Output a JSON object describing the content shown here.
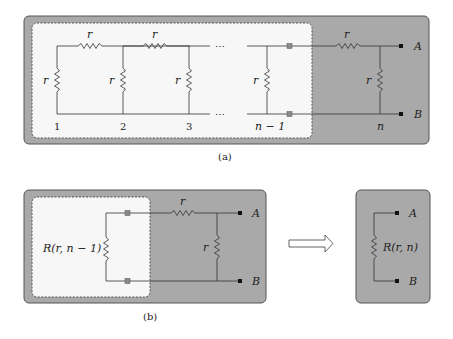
{
  "colors": {
    "panel_fill": "#a9a9a9",
    "panel_border": "#555555",
    "inner_fill": "#f7f7f7",
    "wire": "#333333",
    "node_gray": "#8a8a8a",
    "terminal": "#111111"
  },
  "figure_a": {
    "caption": "(a)",
    "resistor_label": "r",
    "ellipsis": "⋯",
    "node_labels": [
      "1",
      "2",
      "3",
      "n − 1",
      "n"
    ],
    "terminal_a": "A",
    "terminal_b": "B"
  },
  "figure_b": {
    "caption": "(b)",
    "equivalent_label": "R(r, n − 1)",
    "resistor_label": "r",
    "terminal_a": "A",
    "terminal_b": "B"
  },
  "figure_c": {
    "equivalent_label": "R(r, n)",
    "terminal_a": "A",
    "terminal_b": "B"
  },
  "arrow": {
    "direction": "right"
  }
}
